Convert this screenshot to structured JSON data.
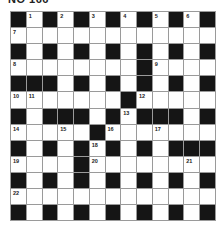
{
  "title": "NO 166",
  "grid": {
    "rows": 13,
    "cols": 13,
    "colors": {
      "block": "#151515",
      "cell": "#ffffff",
      "line": "#9a9a9a"
    },
    "layout": [
      "#.#.#.#.#.#.#",
      ".............",
      "#.#.#.#.#.#.#",
      "........#....",
      "###.#.#.#.#.#",
      ".......#.....",
      "#.###.#.###.#",
      ".....#.......",
      "#.#.#.#.#.###",
      "....#........",
      "#.#.#.#.#.#.#",
      ".............",
      "#.#.#.#.#.#.#"
    ],
    "numbers": [
      {
        "n": "1",
        "r": 0,
        "c": 1
      },
      {
        "n": "2",
        "r": 0,
        "c": 3
      },
      {
        "n": "3",
        "r": 0,
        "c": 5
      },
      {
        "n": "4",
        "r": 0,
        "c": 7
      },
      {
        "n": "5",
        "r": 0,
        "c": 9
      },
      {
        "n": "6",
        "r": 0,
        "c": 11
      },
      {
        "n": "7",
        "r": 1,
        "c": 0
      },
      {
        "n": "8",
        "r": 3,
        "c": 0
      },
      {
        "n": "9",
        "r": 3,
        "c": 9
      },
      {
        "n": "10",
        "r": 5,
        "c": 0
      },
      {
        "n": "11",
        "r": 5,
        "c": 1
      },
      {
        "n": "12",
        "r": 5,
        "c": 8
      },
      {
        "n": "13",
        "r": 6,
        "c": 7
      },
      {
        "n": "14",
        "r": 7,
        "c": 0
      },
      {
        "n": "15",
        "r": 7,
        "c": 3
      },
      {
        "n": "16",
        "r": 7,
        "c": 6
      },
      {
        "n": "17",
        "r": 7,
        "c": 9
      },
      {
        "n": "18",
        "r": 8,
        "c": 5
      },
      {
        "n": "19",
        "r": 9,
        "c": 0
      },
      {
        "n": "20",
        "r": 9,
        "c": 5
      },
      {
        "n": "21",
        "r": 9,
        "c": 11
      },
      {
        "n": "22",
        "r": 11,
        "c": 0
      }
    ]
  }
}
